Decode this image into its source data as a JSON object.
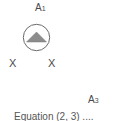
{
  "diagram": {
    "node_top": {
      "label": "A",
      "subscript": "1"
    },
    "node_right": {
      "label": "A",
      "subscript": "3"
    },
    "marks": [
      "X",
      "X"
    ],
    "symbol": "triangle-in-circle-icon",
    "caption": "Equation (2, 3) ....",
    "colors": {
      "stroke": "#6b6b6b",
      "fill": "#8c8c8c",
      "text": "#4a4a4a"
    }
  }
}
